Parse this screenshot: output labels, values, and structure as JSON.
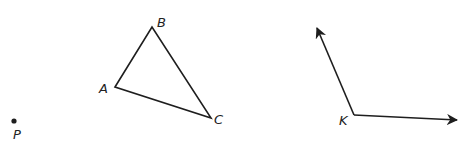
{
  "diagram": {
    "point": {
      "label": "P",
      "x": 14,
      "y": 121
    },
    "triangle": {
      "vertices": [
        {
          "label": "A",
          "x": 115,
          "y": 87
        },
        {
          "label": "B",
          "x": 152,
          "y": 27
        },
        {
          "label": "C",
          "x": 211,
          "y": 118
        }
      ]
    },
    "angle": {
      "vertex": {
        "label": "K",
        "x": 354,
        "y": 115
      },
      "ray1_tip": {
        "x": 316,
        "y": 26
      },
      "ray2_tip": {
        "x": 459,
        "y": 120
      }
    },
    "colors": {
      "stroke": "#1e1e1e",
      "label": "#222222",
      "background": "#ffffff"
    }
  }
}
